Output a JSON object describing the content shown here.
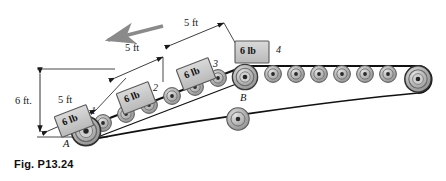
{
  "figure": {
    "caption": "Fig. P13.24",
    "background_color": "#ffffff",
    "line_color": "#1a1a1a",
    "belt_color": "#111111",
    "roller_fill": "#b8b8b8",
    "roller_stroke": "#555555",
    "block_fill": "#c9c9c9",
    "block_stroke": "#5a5a5a",
    "arrow_color": "#8a8a8a"
  },
  "dimensions": [
    {
      "name": "vertical-height",
      "label": "6 ft.",
      "value": 6,
      "unit": "ft"
    },
    {
      "name": "incline-segment-1",
      "label": "5 ft",
      "value": 5,
      "unit": "ft"
    },
    {
      "name": "incline-segment-2",
      "label": "5 ft",
      "value": 5,
      "unit": "ft"
    },
    {
      "name": "incline-segment-3",
      "label": "5 ft",
      "value": 5,
      "unit": "ft"
    }
  ],
  "blocks": [
    {
      "weight_label": "6 lb",
      "number": "1",
      "weight": 6,
      "unit": "lb"
    },
    {
      "weight_label": "6 lb",
      "number": "2",
      "weight": 6,
      "unit": "lb"
    },
    {
      "weight_label": "6 lb",
      "number": "3",
      "weight": 6,
      "unit": "lb"
    },
    {
      "weight_label": "6 lb",
      "number": "4",
      "weight": 6,
      "unit": "lb"
    }
  ],
  "points": [
    {
      "label": "A",
      "name": "pulley-a"
    },
    {
      "label": "B",
      "name": "pulley-b"
    }
  ],
  "motion_arrow": {
    "name": "belt-direction-arrow",
    "direction": "up-left"
  },
  "icons": {
    "roller": "roller-icon",
    "pulley": "pulley-icon",
    "arrow": "arrow-icon"
  }
}
